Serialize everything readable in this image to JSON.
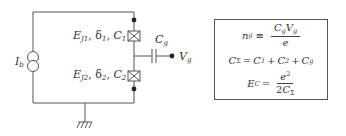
{
  "circuit": {
    "current_source_label": "I",
    "current_source_sub": "b",
    "junction_1": {
      "E": "E",
      "E_sub": "J1",
      "delta": "δ",
      "delta_sub": "1",
      "C": "C",
      "C_sub": "1",
      "sep": ", "
    },
    "junction_2": {
      "E": "E",
      "E_sub": "J2",
      "delta": "δ",
      "delta_sub": "2",
      "C": "C",
      "C_sub": "2",
      "sep": ", "
    },
    "gate_capacitor_label": "C",
    "gate_capacitor_sub": "g",
    "gate_voltage_label": "V",
    "gate_voltage_sub": "g",
    "colors": {
      "wire": "#555555",
      "text": "#333333",
      "background": "#ffffff"
    }
  },
  "equations": {
    "eq1": {
      "lhs": "n",
      "lhs_sub": "g",
      "op": "≡",
      "num_a": "C",
      "num_a_sub": "g",
      "num_b": "V",
      "num_b_sub": "g",
      "den": "e"
    },
    "eq2": {
      "lhs": "C",
      "lhs_sub": "Σ",
      "op": "=",
      "t1": "C",
      "t1_sub": "1",
      "plus": "+",
      "t2": "C",
      "t2_sub": "2",
      "t3": "C",
      "t3_sub": "g"
    },
    "eq3": {
      "lhs": "E",
      "lhs_sub": "C",
      "op": "=",
      "num": "e",
      "num_sup": "2",
      "den_coef": "2",
      "den": "C",
      "den_sub": "Σ"
    }
  }
}
